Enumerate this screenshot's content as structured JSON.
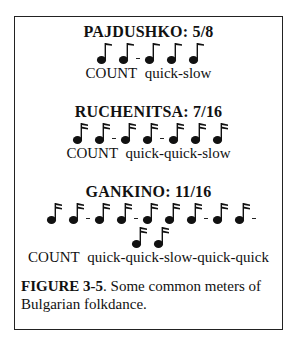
{
  "figure": {
    "sections": [
      {
        "title": "PAJDUSHKO: 5/8",
        "note_type": "eighth-note",
        "groups": [
          2,
          3
        ],
        "count_label": "COUNT",
        "count_pattern": "quick-slow"
      },
      {
        "title": "RUCHENITSA: 7/16",
        "note_type": "sixteenth-note",
        "groups": [
          2,
          2,
          3
        ],
        "count_label": "COUNT",
        "count_pattern": "quick-quick-slow"
      },
      {
        "title": "GANKINO: 11/16",
        "note_type": "sixteenth-note",
        "groups": [
          2,
          2,
          3,
          2,
          2
        ],
        "count_label": "COUNT",
        "count_pattern": "quick-quick-slow-quick-quick"
      }
    ],
    "caption": {
      "label": "FIGURE 3-5",
      "text": ".  Some common meters of Bulgarian folkdance."
    }
  }
}
